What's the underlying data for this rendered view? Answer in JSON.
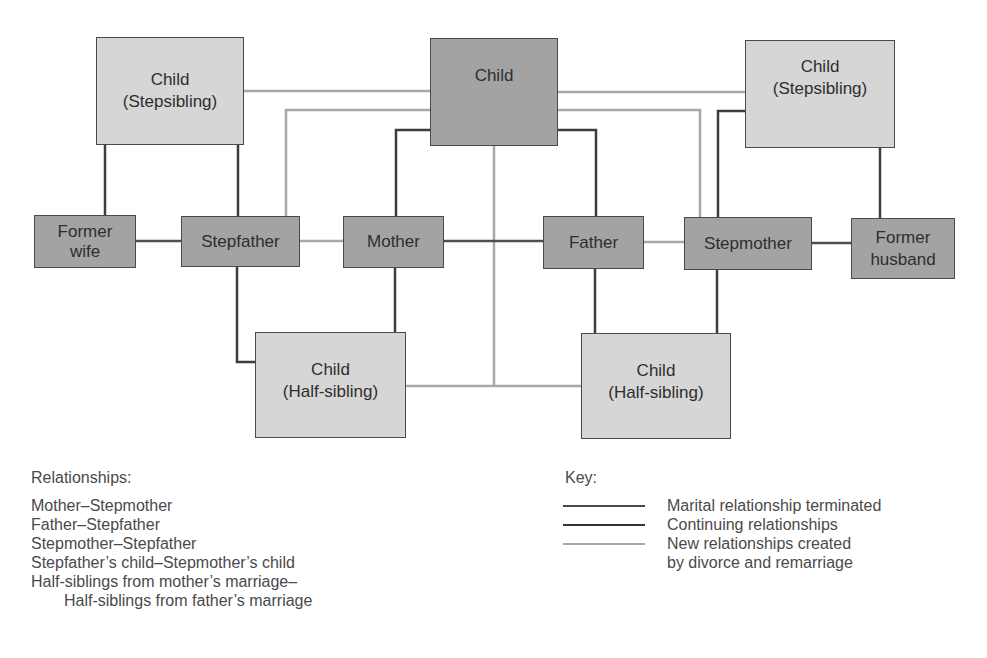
{
  "diagram": {
    "colors": {
      "terminated_line": "#4a4a4a",
      "continuing_line": "#3a3a3a",
      "new_line": "#a8a8a8",
      "primary_box": "#a3a3a3",
      "secondary_box": "#d6d6d6"
    },
    "nodes": {
      "child_center": "Child",
      "stepsibling_left": "Child\n(Stepsibling)",
      "stepsibling_right": "Child\n(Stepsibling)",
      "former_wife": "Former\nwife",
      "stepfather": "Stepfather",
      "mother": "Mother",
      "father": "Father",
      "stepmother": "Stepmother",
      "former_husband": "Former\nhusband",
      "halfsibling_left": "Child\n(Half-sibling)",
      "halfsibling_right": "Child\n(Half-sibling)"
    }
  },
  "relationships": {
    "title": "Relationships:",
    "items": [
      "Mother–Stepmother",
      "Father–Stepfather",
      "Stepmother–Stepfather",
      "Stepfather’s child–Stepmother’s child",
      "Half-siblings from mother’s marriage–",
      "Half-siblings from father’s marriage"
    ]
  },
  "key": {
    "title": "Key:",
    "items": [
      {
        "label": "Marital relationship terminated",
        "color": "#4a4a4a"
      },
      {
        "label": "Continuing relationships",
        "color": "#333333"
      },
      {
        "label": "New relationships created",
        "color": "#a8a8a8"
      },
      {
        "label": "by divorce and remarriage",
        "color": ""
      }
    ]
  }
}
